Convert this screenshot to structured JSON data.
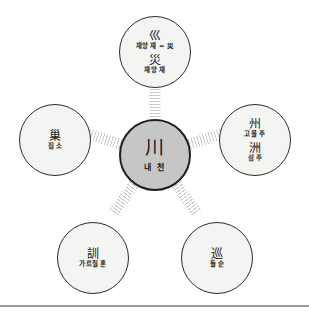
{
  "diagram": {
    "type": "radial-mindmap",
    "center": {
      "hanja": "川",
      "gloss": "내 천"
    },
    "nodes": [
      {
        "id": "top",
        "position": "top",
        "hanja": "巛",
        "gloss": "재앙 재 = 災",
        "hanja2": "災",
        "gloss2": "재앙 재",
        "angle_deg": -90
      },
      {
        "id": "right",
        "position": "right",
        "hanja": "州",
        "gloss": "고을 주",
        "hanja2": "洲",
        "gloss2": "섬 주",
        "angle_deg": -18
      },
      {
        "id": "botright",
        "position": "bottom-right",
        "hanja": "巡",
        "gloss": "돌 순",
        "hanja2": "",
        "gloss2": "",
        "angle_deg": 54
      },
      {
        "id": "botleft",
        "position": "bottom-left",
        "hanja": "訓",
        "gloss": "가르칠 훈",
        "hanja2": "",
        "gloss2": "",
        "angle_deg": 126
      },
      {
        "id": "left",
        "position": "left",
        "hanja": "巢",
        "gloss": "집 소",
        "hanja2": "",
        "gloss2": "",
        "angle_deg": 198
      }
    ],
    "colors": {
      "center_fill": "#c6c6c6",
      "satellite_fill": "#f4f4f2",
      "node_border": "#2b2b2b",
      "connector": "#c9c9c9",
      "divider": "#9a9a9a",
      "background": "#ffffff",
      "text": "#1a1a1a"
    }
  }
}
